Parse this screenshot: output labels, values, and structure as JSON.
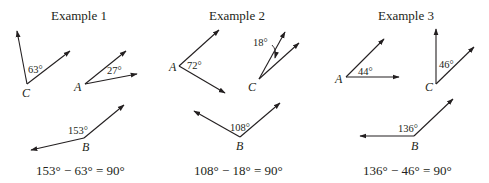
{
  "examples": [
    {
      "title": "Example 1",
      "angles": [
        {
          "vertex": "C",
          "measure": "63°"
        },
        {
          "vertex": "A",
          "measure": "27°"
        },
        {
          "vertex": "B",
          "measure": "153°"
        }
      ],
      "equation": "153° − 63° = 90°"
    },
    {
      "title": "Example 2",
      "angles": [
        {
          "vertex": "A",
          "measure": "72°"
        },
        {
          "vertex": "C",
          "measure": "18°"
        },
        {
          "vertex": "B",
          "measure": "108°"
        }
      ],
      "equation": "108° − 18° = 90°"
    },
    {
      "title": "Example 3",
      "angles": [
        {
          "vertex": "A",
          "measure": "44°"
        },
        {
          "vertex": "C",
          "measure": "46°"
        },
        {
          "vertex": "B",
          "measure": "136°"
        }
      ],
      "equation": "136° − 46° = 90°"
    }
  ],
  "colors": {
    "ink": "#231f20",
    "background": "#ffffff"
  }
}
